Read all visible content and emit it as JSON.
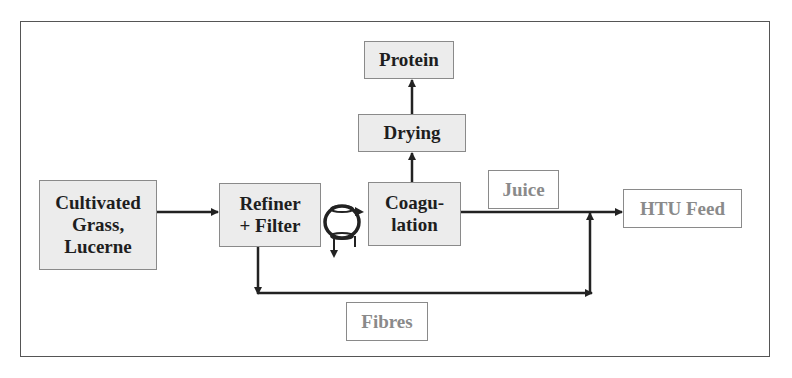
{
  "diagram": {
    "type": "process-flow",
    "nodes": {
      "feedstock": {
        "label_line1": "Cultivated",
        "label_line2": "Grass,",
        "label_line3": "Lucerne"
      },
      "refiner": {
        "label_line1": "Refiner",
        "label_line2": "+ Filter"
      },
      "coagulation": {
        "label_line1": "Coagu-",
        "label_line2": "lation"
      },
      "drying": {
        "label": "Drying"
      },
      "protein": {
        "label": "Protein"
      },
      "juice": {
        "label": "Juice"
      },
      "htu_feed": {
        "label": "HTU Feed"
      },
      "fibres": {
        "label": "Fibres"
      }
    },
    "edges": [
      {
        "from": "Cultivated Grass, Lucerne",
        "to": "Refiner + Filter"
      },
      {
        "from": "Refiner + Filter",
        "to": "Coagulation",
        "via": "recycle-loop"
      },
      {
        "from": "Coagulation",
        "to": "Drying"
      },
      {
        "from": "Drying",
        "to": "Protein"
      },
      {
        "from": "Coagulation",
        "to": "HTU Feed",
        "label": "Juice"
      },
      {
        "from": "Refiner + Filter",
        "to": "HTU Feed",
        "label": "Fibres"
      }
    ],
    "colors": {
      "process_fill": "#ececec",
      "border": "#8a8a8a",
      "output_text": "#8a8a8a",
      "line": "#222222"
    }
  }
}
